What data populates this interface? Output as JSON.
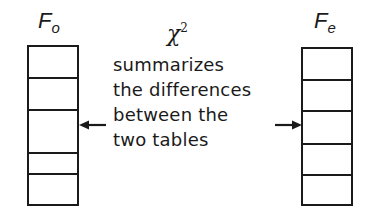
{
  "diagram": {
    "left_table": {
      "label_main": "F",
      "label_sub": "o",
      "rows": 5
    },
    "right_table": {
      "label_main": "F",
      "label_sub": "e",
      "rows": 5
    },
    "statistic": {
      "symbol": "χ",
      "superscript": "2"
    },
    "caption_lines": [
      "summarizes",
      "the differences",
      "between the",
      "two tables"
    ],
    "arrows": [
      {
        "direction": "left",
        "target": "left_table"
      },
      {
        "direction": "right",
        "target": "right_table"
      }
    ],
    "colors": {
      "ink": "#1a1a1a",
      "background": "#ffffff"
    }
  }
}
